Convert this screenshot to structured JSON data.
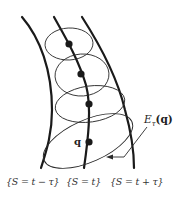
{
  "diagram": {
    "label_E": "E",
    "label_E_sub": "τ",
    "label_E_arg": "(q)",
    "point_label": "q",
    "level_sets": [
      {
        "label": "{S = t − τ}"
      },
      {
        "label": "{S = t}"
      },
      {
        "label": "{S = t + τ}"
      }
    ],
    "curves": [
      {
        "name": "level-set-t-minus-tau",
        "path": "M22,17 C40,38 52,70 52,110 C52,135 46,152 41,168"
      },
      {
        "name": "level-set-t",
        "path": "M54,17 C64,35 78,58 86,85 C92,108 88,140 84,168"
      },
      {
        "name": "level-set-t-plus-tau",
        "path": "M82,17 C100,45 118,80 125,110 C132,135 134,152 134,168"
      }
    ],
    "ellipses": [
      {
        "cx": 69,
        "cy": 44,
        "rx": 24,
        "ry": 16,
        "rotate": -3
      },
      {
        "cx": 82,
        "cy": 75,
        "rx": 27,
        "ry": 21,
        "rotate": -4
      },
      {
        "cx": 90,
        "cy": 104,
        "rx": 35,
        "ry": 18,
        "rotate": -8
      },
      {
        "cx": 88,
        "cy": 141,
        "rx": 48,
        "ry": 21,
        "rotate": -24
      }
    ],
    "points": [
      {
        "cx": 69,
        "cy": 44
      },
      {
        "cx": 81,
        "cy": 74
      },
      {
        "cx": 89,
        "cy": 104
      },
      {
        "cx": 89,
        "cy": 142
      }
    ]
  }
}
